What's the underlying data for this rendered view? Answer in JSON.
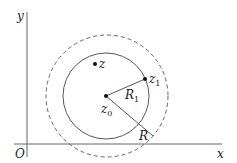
{
  "axes": {
    "x_label": "x",
    "y_label": "y",
    "origin_label": "O"
  },
  "points": {
    "z": {
      "label": "z"
    },
    "z0": {
      "label": "z",
      "sub": "0"
    },
    "z1": {
      "label": "z",
      "sub": "1"
    }
  },
  "radii": {
    "R1": {
      "label": "R",
      "sub": "1"
    },
    "R": {
      "label": "R"
    }
  },
  "colors": {
    "stroke": "#444444",
    "text": "#222222"
  }
}
